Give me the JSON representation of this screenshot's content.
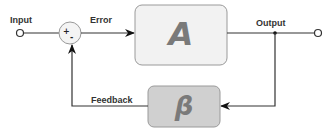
{
  "diagram": {
    "type": "negative-feedback-loop",
    "nodes": {
      "input": {
        "label": "Input"
      },
      "summing_junction": {
        "plus_sign": "+",
        "minus_sign": "-"
      },
      "block_a": {
        "label": "A",
        "fill": "#f2f2f2"
      },
      "output": {
        "label": "Output"
      },
      "block_b": {
        "label": "β",
        "fill": "#d0d0d0"
      }
    },
    "edges": {
      "error": {
        "label": "Error"
      },
      "feedback": {
        "label": "Feedback"
      }
    },
    "colors": {
      "line": "#333333",
      "box_border": "#9a9a9a",
      "box_text": "#7a7a7a"
    }
  }
}
